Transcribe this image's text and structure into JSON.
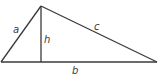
{
  "diagram": {
    "type": "triangle-with-altitude",
    "vertices": {
      "left": {
        "x": 1,
        "y": 62
      },
      "apex": {
        "x": 41,
        "y": 6
      },
      "right": {
        "x": 157,
        "y": 62
      }
    },
    "altitude_foot": {
      "x": 41,
      "y": 62
    },
    "labels": {
      "side_a": "a",
      "side_b": "b",
      "side_c": "c",
      "height": "h"
    },
    "label_positions": {
      "side_a": {
        "x": 13,
        "y": 33
      },
      "side_b": {
        "x": 72,
        "y": 74
      },
      "side_c": {
        "x": 94,
        "y": 30
      },
      "height": {
        "x": 44,
        "y": 43
      }
    },
    "stroke_color": "#3a3a3a",
    "background_color": "#ffffff"
  }
}
